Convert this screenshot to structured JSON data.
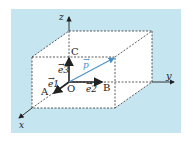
{
  "diagram": {
    "axes": {
      "x": "x",
      "y": "y",
      "z": "z"
    },
    "points": {
      "O": "O",
      "A": "A",
      "B": "B",
      "C": "C"
    },
    "vectors": {
      "e1": "e1",
      "e2": "e2",
      "e3": "e3",
      "p": "p"
    },
    "colors": {
      "background": "#c5e6f1",
      "box": "#ffffff",
      "vector_p": "#4a90c8",
      "basis": "#222222"
    }
  }
}
